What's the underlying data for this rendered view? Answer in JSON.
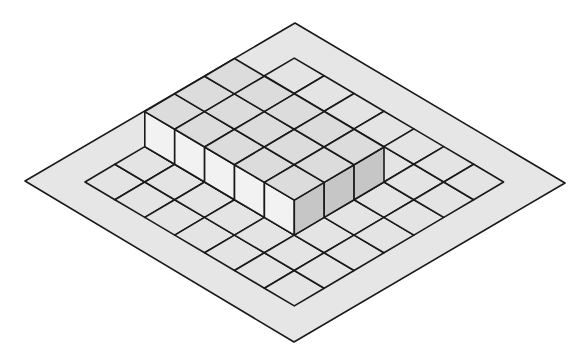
{
  "diagram": {
    "type": "isometric-grid-with-block",
    "grid": {
      "cells_i": 7,
      "cells_j": 7
    },
    "block": {
      "i_from": 0,
      "i_to": 5,
      "j_from": 2,
      "j_to": 5,
      "height_units": 1
    },
    "colors": {
      "background": "#ffffff",
      "outer_border": "#e6e6e6",
      "ground": "#e4e4e4",
      "block_top": "#dcdcdc",
      "block_left_face": "#f2f2f2",
      "block_right_face": "#c6c6c6",
      "line": "#1a1a1a"
    }
  }
}
